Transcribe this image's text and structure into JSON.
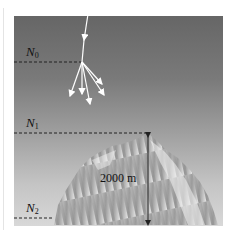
{
  "diagram": {
    "type": "cosmic-ray-shower-altitude",
    "levels": [
      {
        "id": "N0",
        "symbol": "N",
        "subscript": "0",
        "y_line": 62
      },
      {
        "id": "N1",
        "symbol": "N",
        "subscript": "1",
        "y_line": 133
      },
      {
        "id": "N2",
        "symbol": "N",
        "subscript": "2",
        "y_line": 218
      }
    ],
    "height_label": "2000 m",
    "colors": {
      "sky_top": "#666666",
      "sky_bottom": "#d8d8d8",
      "arrows": "#ffffff",
      "dashed_lines": "#222222",
      "measure_line": "#222222"
    }
  }
}
